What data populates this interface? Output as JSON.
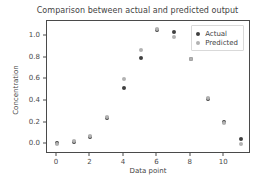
{
  "chart_data": {
    "type": "scatter",
    "title": "Comparison between actual and predicted output",
    "xlabel": "Data point",
    "ylabel": "Concentration",
    "x": [
      0,
      1,
      2,
      3,
      4,
      5,
      6,
      7,
      8,
      9,
      10,
      11
    ],
    "series": [
      {
        "name": "Actual",
        "color": "#3f3f3f",
        "values": [
          0.01,
          0.02,
          0.07,
          0.245,
          0.52,
          0.8,
          1.06,
          1.04,
          0.79,
          0.42,
          0.21,
          0.05
        ]
      },
      {
        "name": "Predicted",
        "color": "#b2b2b2",
        "values": [
          0.0,
          0.03,
          0.08,
          0.25,
          0.6,
          0.87,
          1.07,
          0.99,
          0.79,
          0.43,
          0.2,
          0.0
        ]
      }
    ],
    "xlim": [
      -0.6,
      11.6
    ],
    "ylim": [
      -0.09,
      1.14
    ],
    "xticks": [
      0,
      2,
      4,
      6,
      8,
      10
    ],
    "xtick_labels": [
      "0",
      "2",
      "4",
      "6",
      "8",
      "10"
    ],
    "yticks": [
      0.0,
      0.2,
      0.4,
      0.6,
      0.8,
      1.0
    ],
    "ytick_labels": [
      "0.0",
      "0.2",
      "0.4",
      "0.6",
      "0.8",
      "1.0"
    ],
    "grid": false,
    "legend_position": "upper right",
    "marker": "circle",
    "background_color": "#ffffff",
    "axes_color": "#4a4a4a"
  },
  "legend": {
    "entries": [
      {
        "label": "Actual"
      },
      {
        "label": "Predicted"
      }
    ]
  }
}
